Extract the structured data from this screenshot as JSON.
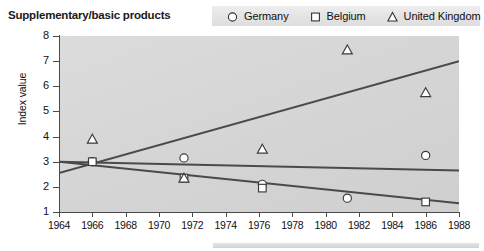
{
  "chart_data": {
    "type": "scatter",
    "title": "Supplementary/basic products",
    "xlabel": "",
    "ylabel": "Index value",
    "xlim": [
      1964,
      1988
    ],
    "ylim": [
      1,
      8
    ],
    "grid": false,
    "legend_position": "top-right",
    "xticks": [
      1964,
      1966,
      1968,
      1970,
      1972,
      1974,
      1976,
      1978,
      1980,
      1982,
      1984,
      1986,
      1988
    ],
    "yticks": [
      1,
      2,
      3,
      4,
      5,
      6,
      7,
      8
    ],
    "series": [
      {
        "name": "Germany",
        "marker": "circle",
        "points": [
          {
            "x": 1966.0,
            "y": 3.0
          },
          {
            "x": 1971.5,
            "y": 3.15
          },
          {
            "x": 1976.2,
            "y": 2.1
          },
          {
            "x": 1981.3,
            "y": 1.55
          },
          {
            "x": 1986.0,
            "y": 3.25
          }
        ],
        "trend": {
          "x0": 1964,
          "y0": 3.0,
          "x1": 1988,
          "y1": 2.65
        }
      },
      {
        "name": "Belgium",
        "marker": "square",
        "points": [
          {
            "x": 1966.0,
            "y": 3.0
          },
          {
            "x": 1971.5,
            "y": 2.35
          },
          {
            "x": 1976.2,
            "y": 1.95
          },
          {
            "x": 1986.0,
            "y": 1.4
          }
        ],
        "trend": {
          "x0": 1964,
          "y0": 3.0,
          "x1": 1988,
          "y1": 1.35
        }
      },
      {
        "name": "United Kingdom",
        "marker": "triangle",
        "points": [
          {
            "x": 1966.0,
            "y": 3.9
          },
          {
            "x": 1971.5,
            "y": 2.35
          },
          {
            "x": 1976.2,
            "y": 3.5
          },
          {
            "x": 1981.3,
            "y": 7.45
          },
          {
            "x": 1986.0,
            "y": 5.75
          }
        ],
        "trend": {
          "x0": 1964,
          "y0": 2.55,
          "x1": 1988,
          "y1": 7.0
        }
      }
    ]
  },
  "legend": {
    "germany_label": "Germany",
    "belgium_label": "Belgium",
    "uk_label": "United Kingdom"
  },
  "colors": {
    "line": "#4a4a4a",
    "marker_stroke": "#3a3a3a",
    "marker_fill": "#ffffff",
    "plot_background": "#d6d6d6",
    "legend_background": "#e3e3e3",
    "text": "#1a1a1a"
  }
}
